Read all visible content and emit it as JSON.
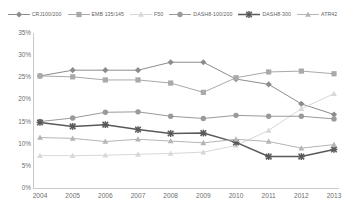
{
  "chart_data": {
    "type": "line",
    "title": "",
    "xlabel": "",
    "ylabel": "",
    "x": [
      2004,
      2005,
      2006,
      2007,
      2008,
      2009,
      2010,
      2011,
      2012,
      2013
    ],
    "categories": [
      "2004",
      "2005",
      "2006",
      "2007",
      "2008",
      "2009",
      "2010",
      "2011",
      "2012",
      "2013"
    ],
    "ylim": [
      0,
      35
    ],
    "ytick_labels": [
      "0%",
      "5%",
      "10%",
      "15%",
      "20%",
      "25%",
      "30%",
      "35%"
    ],
    "ytick_values": [
      0,
      5,
      10,
      15,
      20,
      25,
      30,
      35
    ],
    "grid": false,
    "legend_position": "top",
    "value_unit": "percent",
    "series": [
      {
        "name": "CRJ100/200",
        "color": "#8c8c8c",
        "marker": "diamond",
        "values": [
          25.3,
          26.6,
          26.6,
          26.6,
          28.4,
          28.4,
          24.6,
          23.4,
          19.0,
          16.6
        ]
      },
      {
        "name": "EMB 135/145",
        "color": "#a9a9a9",
        "marker": "square",
        "values": [
          25.3,
          25.1,
          24.4,
          24.4,
          23.7,
          21.6,
          24.9,
          26.2,
          26.4,
          25.8
        ]
      },
      {
        "name": "F50",
        "color": "#d8d8d8",
        "marker": "triangle",
        "values": [
          7.3,
          7.3,
          7.4,
          7.6,
          7.8,
          8.1,
          9.6,
          13.0,
          17.9,
          21.3
        ]
      },
      {
        "name": "DASH8-100/200",
        "color": "#9a9a9a",
        "marker": "circle",
        "values": [
          15.0,
          15.8,
          17.1,
          17.2,
          16.2,
          15.7,
          16.4,
          16.2,
          16.2,
          15.6
        ]
      },
      {
        "name": "DASH8-300",
        "color": "#595959",
        "marker": "x",
        "values": [
          14.8,
          13.9,
          14.3,
          13.2,
          12.3,
          12.4,
          10.3,
          7.1,
          7.1,
          8.7
        ]
      },
      {
        "name": "ATR42",
        "color": "#b5b5b5",
        "marker": "triangle",
        "values": [
          11.4,
          11.2,
          10.5,
          11.0,
          10.6,
          10.2,
          11.0,
          10.5,
          9.0,
          9.8
        ]
      }
    ]
  },
  "legend": {
    "items": [
      {
        "label": "CRJ100/200"
      },
      {
        "label": "EMB 135/145"
      },
      {
        "label": "F50"
      },
      {
        "label": "DASH8-100/200"
      },
      {
        "label": "DASH8-300"
      },
      {
        "label": "ATR42"
      }
    ]
  },
  "axes": {
    "y_labels": [
      "35%",
      "30%",
      "25%",
      "20%",
      "15%",
      "10%",
      "5%",
      "0%"
    ],
    "x_labels": [
      "2004",
      "2005",
      "2006",
      "2007",
      "2008",
      "2009",
      "2010",
      "2011",
      "2012",
      "2013"
    ]
  }
}
